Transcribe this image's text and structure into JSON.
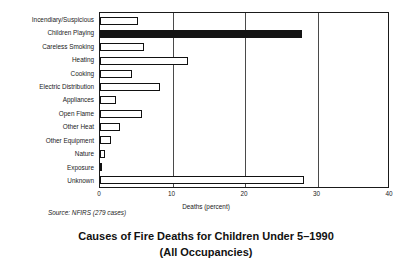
{
  "chart_data": {
    "type": "bar",
    "orientation": "horizontal",
    "title": "Causes of Fire Deaths for Children Under 5–1990",
    "subtitle": "(All Occupancies)",
    "title_lines": [
      "Causes of Fire Deaths for Children Under 5–1990",
      "(All Occupancies)"
    ],
    "xlabel": "Deaths (percent)",
    "ylabel": "",
    "source": "Source: NFIRS (279 cases)",
    "xlim": [
      0,
      40
    ],
    "xticks": [
      0,
      10,
      20,
      30,
      40
    ],
    "xtick_labels": [
      "0",
      "10",
      "20",
      "30",
      "40"
    ],
    "grid": true,
    "grid_axis": "x",
    "legend": null,
    "categories": [
      "Incendiary/Suspicious",
      "Children Playing",
      "Careless Smoking",
      "Heating",
      "Cooking",
      "Electric Distribution",
      "Appliances",
      "Open Flame",
      "Other Heat",
      "Other Equipment",
      "Nature",
      "Exposure",
      "Unknown"
    ],
    "values": [
      5.3,
      27.8,
      6.1,
      12.2,
      4.4,
      8.3,
      2.2,
      5.8,
      2.8,
      1.5,
      0.7,
      0.3,
      28.1
    ],
    "highlighted_category": "Children Playing",
    "colors": {
      "bar_fill": "#ffffff",
      "bar_edge": "#111111",
      "bar_highlight": "#141414",
      "grid": "#4a4a4a",
      "axis": "#1a1a1a",
      "background": "#ffffff",
      "text": "#1a1a1a"
    }
  }
}
